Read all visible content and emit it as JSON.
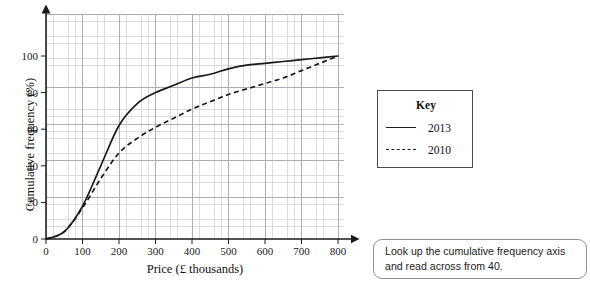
{
  "chart_data": {
    "type": "line",
    "title": "",
    "xlabel": "Price (£ thousands)",
    "ylabel": "Cumulative frequency (%)",
    "xlim": [
      0,
      800
    ],
    "ylim": [
      0,
      110
    ],
    "xticks": [
      0,
      100,
      200,
      300,
      400,
      500,
      600,
      700,
      800
    ],
    "yticks": [
      0,
      20,
      40,
      60,
      80,
      100
    ],
    "xtick_labels": [
      "0",
      "100",
      "200",
      "300",
      "400",
      "500",
      "600",
      "700",
      "800"
    ],
    "ytick_labels": [
      "0",
      "20",
      "40",
      "60",
      "80",
      "100"
    ],
    "grid": true,
    "grid_minor": true,
    "legend_position": "right-outside",
    "legend_title": "Key",
    "x": [
      0,
      50,
      100,
      150,
      200,
      250,
      300,
      350,
      400,
      450,
      500,
      550,
      600,
      650,
      700,
      750,
      800
    ],
    "series": [
      {
        "name": "2013",
        "style": "solid",
        "color": "#1a1a1a",
        "values": [
          0,
          4,
          18,
          40,
          62,
          74,
          80,
          84,
          88,
          90,
          93,
          95,
          96,
          97,
          98,
          99,
          100
        ]
      },
      {
        "name": "2010",
        "style": "dashed",
        "color": "#1a1a1a",
        "values": [
          0,
          4,
          17,
          33,
          47,
          55,
          61,
          66,
          71,
          75,
          79,
          82,
          85,
          88,
          92,
          96,
          100
        ]
      }
    ]
  },
  "chart": {
    "x_axis_title": "Price (£ thousands)",
    "y_axis_title": "Cumulative frequency (%)",
    "x_tick_labels": [
      "0",
      "100",
      "200",
      "300",
      "400",
      "500",
      "600",
      "700",
      "800"
    ],
    "y_tick_labels": [
      "0",
      "20",
      "40",
      "60",
      "80",
      "100"
    ]
  },
  "key": {
    "title": "Key",
    "entries": [
      {
        "label": "2013",
        "style": "solid"
      },
      {
        "label": "2010",
        "style": "dashed"
      }
    ]
  },
  "hint": {
    "text": "Look up the cumulative frequency axis and read across from 40."
  }
}
